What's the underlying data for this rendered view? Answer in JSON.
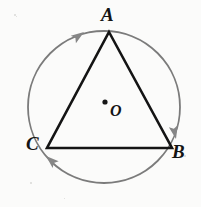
{
  "figure": {
    "type": "geometry-diagram",
    "canvas": {
      "width": 201,
      "height": 207,
      "background": "#fbfbfa"
    },
    "colors": {
      "triangle_stroke": "#141414",
      "circle_stroke": "#7b7b7b",
      "arrow_fill": "#868686",
      "label_text": "#141414",
      "center_dot": "#161616"
    },
    "circle": {
      "name": "circumscribed-circle",
      "center_x": 104,
      "center_y": 107,
      "radius": 76,
      "stroke_width": 1.8
    },
    "center_point": {
      "label": "O",
      "dot_x": 105,
      "dot_y": 102,
      "dot_radius": 2.6
    },
    "triangle": {
      "name": "inscribed-triangle",
      "stroke_width": 2.6,
      "vertices": [
        {
          "label": "A",
          "x": 109,
          "y": 32,
          "label_x": 101,
          "label_y": 5
        },
        {
          "label": "B",
          "x": 172,
          "y": 148,
          "label_x": 172,
          "label_y": 142
        },
        {
          "label": "C",
          "x": 47,
          "y": 148,
          "label_x": 26,
          "label_y": 134
        }
      ],
      "edges": [
        "AB",
        "BC",
        "CA"
      ]
    },
    "arrows": {
      "direction": "clockwise",
      "sequence": [
        "C to A",
        "A to B",
        "B to C"
      ],
      "markers": [
        {
          "name": "arrow-toward-a",
          "tip_x": 84,
          "tip_y": 32,
          "angle_deg": -35
        },
        {
          "name": "arrow-toward-b",
          "tip_x": 176,
          "tip_y": 139,
          "angle_deg": 78
        },
        {
          "name": "arrow-toward-c",
          "tip_x": 46,
          "tip_y": 156,
          "angle_deg": -138
        }
      ]
    },
    "speckles": [
      {
        "x": 14,
        "y": 14,
        "size": 2
      },
      {
        "x": 16,
        "y": 16,
        "size": 1
      },
      {
        "x": 184,
        "y": 155,
        "size": 2
      },
      {
        "x": 30,
        "y": 182,
        "size": 2
      },
      {
        "x": 64,
        "y": 198,
        "size": 1
      }
    ]
  }
}
